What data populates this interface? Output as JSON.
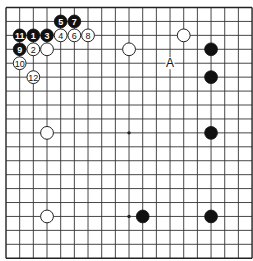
{
  "board": {
    "size": 19,
    "origin_x": 6,
    "origin_y": 7.5,
    "spacing_x": 13.67,
    "spacing_y": 13.93,
    "stone_radius": 6.4,
    "hoshi": [
      [
        3,
        3
      ],
      [
        3,
        9
      ],
      [
        3,
        15
      ],
      [
        9,
        3
      ],
      [
        9,
        9
      ],
      [
        9,
        15
      ],
      [
        15,
        3
      ],
      [
        15,
        9
      ],
      [
        15,
        15
      ]
    ]
  },
  "stones": [
    {
      "color": "black",
      "col": 4,
      "row": 1,
      "label": "5"
    },
    {
      "color": "black",
      "col": 5,
      "row": 1,
      "label": "7"
    },
    {
      "color": "black",
      "col": 1,
      "row": 2,
      "label": "11"
    },
    {
      "color": "black",
      "col": 2,
      "row": 2,
      "label": "1"
    },
    {
      "color": "black",
      "col": 3,
      "row": 2,
      "label": "3"
    },
    {
      "color": "white",
      "col": 4,
      "row": 2,
      "label": "4"
    },
    {
      "color": "white",
      "col": 5,
      "row": 2,
      "label": "6"
    },
    {
      "color": "white",
      "col": 6,
      "row": 2,
      "label": "8"
    },
    {
      "color": "black",
      "col": 1,
      "row": 3,
      "label": "9"
    },
    {
      "color": "white",
      "col": 2,
      "row": 3,
      "label": "2"
    },
    {
      "color": "white",
      "col": 3,
      "row": 3,
      "label": ""
    },
    {
      "color": "white",
      "col": 1,
      "row": 4,
      "label": "10"
    },
    {
      "color": "white",
      "col": 2,
      "row": 5,
      "label": "12"
    },
    {
      "color": "white",
      "col": 9,
      "row": 3,
      "label": ""
    },
    {
      "color": "white",
      "col": 13,
      "row": 2,
      "label": ""
    },
    {
      "color": "black",
      "col": 15,
      "row": 3,
      "label": ""
    },
    {
      "color": "black",
      "col": 15,
      "row": 5,
      "label": ""
    },
    {
      "color": "white",
      "col": 3,
      "row": 9,
      "label": ""
    },
    {
      "color": "black",
      "col": 15,
      "row": 9,
      "label": ""
    },
    {
      "color": "white",
      "col": 3,
      "row": 15,
      "label": ""
    },
    {
      "color": "black",
      "col": 10,
      "row": 15,
      "label": ""
    },
    {
      "color": "black",
      "col": 15,
      "row": 15,
      "label": ""
    }
  ],
  "marks": [
    {
      "col": 12,
      "row": 4,
      "label": "A"
    }
  ]
}
